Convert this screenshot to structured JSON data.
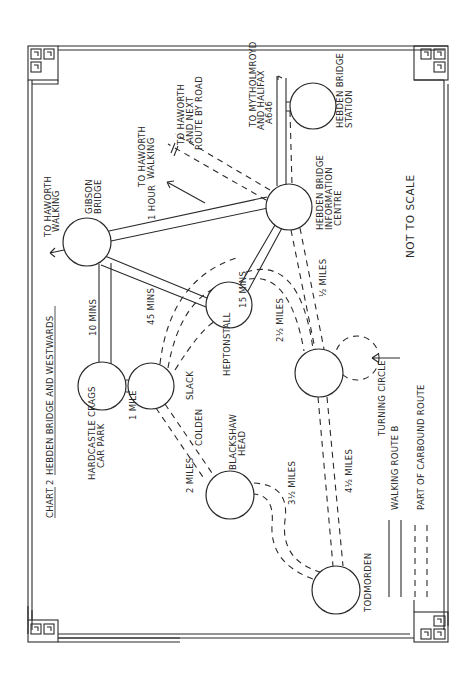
{
  "title": {
    "chart_label": "CHART 2",
    "heading": "HEBDEN BRIDGE AND WESTWARDS"
  },
  "note": "NOT TO SCALE",
  "nodes": [
    {
      "id": "gibson-bridge",
      "label_lines": [
        "GIBSON",
        "BRIDGE"
      ],
      "cx": 87,
      "cy": 242,
      "r": 24
    },
    {
      "id": "hardcastle-crags",
      "label_lines": [
        "HARDCASTLE CRAGS",
        "CAR PARK"
      ],
      "cx": 102,
      "cy": 386,
      "r": 24
    },
    {
      "id": "slack",
      "label_lines": [
        "SLACK"
      ],
      "cx": 151,
      "cy": 386,
      "r": 23
    },
    {
      "id": "heptonstall",
      "label_lines": [
        "HEPTONSTALL"
      ],
      "cx": 229,
      "cy": 305,
      "r": 23
    },
    {
      "id": "hebden-bridge-info",
      "label_lines": [
        "HEBDEN BRIDGE",
        "INFORMATION",
        "CENTRE"
      ],
      "cx": 289,
      "cy": 207,
      "r": 23
    },
    {
      "id": "hebden-bridge-station",
      "label_lines": [
        "HEBDEN BRIDGE",
        "STATION"
      ],
      "cx": 313,
      "cy": 106,
      "r": 23
    },
    {
      "id": "blackshaw-head",
      "label_lines": [
        "BLACKSHAW",
        "HEAD"
      ],
      "cx": 230,
      "cy": 495,
      "r": 24
    },
    {
      "id": "junction",
      "label_lines": [],
      "cx": 319,
      "cy": 373,
      "r": 24
    },
    {
      "id": "todmorden",
      "label_lines": [
        "TODMORDEN"
      ],
      "cx": 336,
      "cy": 590,
      "r": 24
    }
  ],
  "turning_circle": {
    "label": "TURNING CIRCLE",
    "cx": 357,
    "cy": 358,
    "r": 22
  },
  "edge_labels": {
    "gibson_info": "1 HOUR",
    "gibson_heptonstall": "45 MINS",
    "gibson_hardcastle": "10 MINS",
    "hardcastle_slack": "1 MILE",
    "heptonstall_info": "15 MINS",
    "info_junction": "1/2 MILES",
    "heptonstall_junction": "2 1/2 MILES",
    "slack_blackshaw": "2 MILES",
    "colden": "COLDEN",
    "blackshaw_todmorden": "3 1/2 MILES",
    "junction_todmorden": "4 1/2 MILES"
  },
  "directions": {
    "gibson_haworth": [
      "TO HAWORTH",
      "WALKING"
    ],
    "info_haworth_walking": [
      "TO HAWORTH",
      "WALKING"
    ],
    "info_haworth_road": [
      "TO HAWORTH",
      "AND NEXT",
      "ROUTE BY ROAD"
    ],
    "mytholmroyd": [
      "TO MYTHOLMROYD",
      "AND HALIFAX",
      "A646"
    ]
  },
  "legend": [
    {
      "style": "solid",
      "label": "WALKING ROUTE B"
    },
    {
      "style": "dashed",
      "label": "PART OF CARBOUND ROUTE"
    }
  ],
  "colors": {
    "ink": "#2a2a2a",
    "paper": "#ffffff"
  }
}
